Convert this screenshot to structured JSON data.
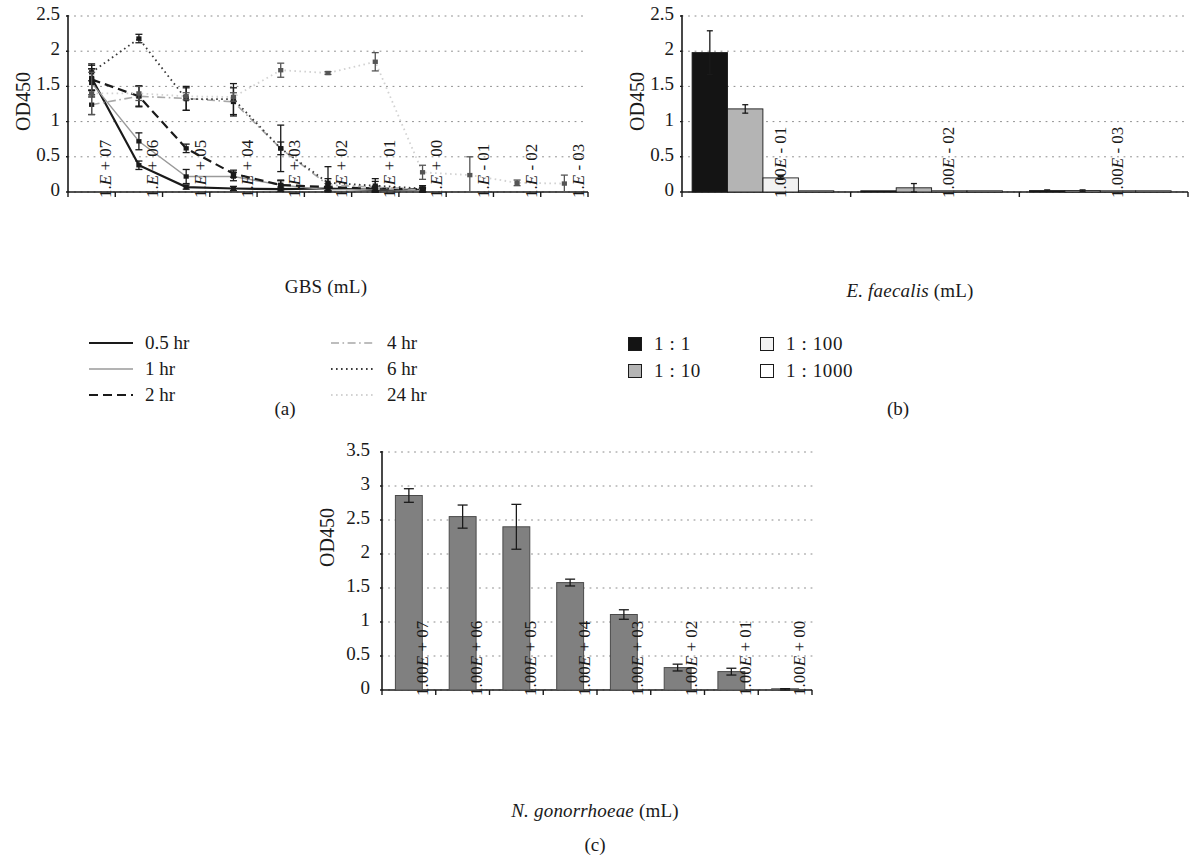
{
  "figure": {
    "panels": [
      {
        "id": "a",
        "caption": "(a)"
      },
      {
        "id": "b",
        "caption": "(b)"
      },
      {
        "id": "c",
        "caption": "(c)"
      }
    ]
  },
  "panel_a": {
    "caption": "(a)",
    "ylabel": "OD450",
    "xlabel": "GBS (mL)",
    "legend": [
      {
        "label": "0.5 hr",
        "style": "solid",
        "color": "#1a1a1a",
        "width": 2.2
      },
      {
        "label": "1 hr",
        "style": "solid",
        "color": "#9a9a9a",
        "width": 1.4
      },
      {
        "label": "2 hr",
        "style": "dashed",
        "color": "#1a1a1a",
        "width": 2.2
      },
      {
        "label": "4 hr",
        "style": "dashdot",
        "color": "#a8a8a8",
        "width": 1.6
      },
      {
        "label": "6 hr",
        "style": "dotted",
        "color": "#3a3a3a",
        "width": 1.8
      },
      {
        "label": "24 hr",
        "style": "dotted",
        "color": "#d2d2d2",
        "width": 1.8
      }
    ]
  },
  "panel_b": {
    "caption": "(b)",
    "ylabel": "OD450",
    "xlabel_parts": {
      "italic": "E. faecalis",
      "plain": " (mL)"
    },
    "legend": [
      {
        "label": "1 : 1",
        "fill": "#141414"
      },
      {
        "label": "1 : 10",
        "fill": "#b4b4b4"
      },
      {
        "label": "1 : 100",
        "fill": "#f2f2f2"
      },
      {
        "label": "1 : 1000",
        "fill": "#ffffff"
      }
    ]
  },
  "panel_c": {
    "caption": "(c)",
    "ylabel": "OD450",
    "xlabel_parts": {
      "italic": "N. gonorrhoeae",
      "plain": " (mL)"
    },
    "bar_fill": "#808080"
  },
  "chart_data": [
    {
      "panel": "a",
      "type": "line",
      "title": "",
      "xlabel": "GBS (mL)",
      "ylabel": "OD450",
      "ylim": [
        0,
        2.5
      ],
      "yticks": [
        "0",
        "0.5",
        "1",
        "1.5",
        "2",
        "2.5"
      ],
      "grid": "horizontal-dotted",
      "legend_position": "below",
      "categories": [
        "1.E + 07",
        "1.E + 06",
        "1.E + 05",
        "1.E + 04",
        "1.E + 03",
        "1.E + 02",
        "1.E + 01",
        "1.E + 00",
        "1.E - 01",
        "1.E - 02",
        "1.E - 03"
      ],
      "series": [
        {
          "name": "0.5 hr",
          "values": [
            1.62,
            0.38,
            0.07,
            0.05,
            0.04,
            0.05,
            0.03,
            0.03,
            null,
            null,
            null
          ],
          "errors": [
            0.18,
            0.06,
            0.03,
            0.03,
            0.03,
            0.03,
            0.03,
            0.02,
            null,
            null,
            null
          ]
        },
        {
          "name": "1 hr",
          "values": [
            1.55,
            0.72,
            0.22,
            0.22,
            0.1,
            0.03,
            0.04,
            0.02,
            null,
            null,
            null
          ],
          "errors": [
            0.2,
            0.12,
            0.1,
            0.06,
            0.06,
            0.02,
            0.04,
            0.02,
            null,
            null,
            null
          ]
        },
        {
          "name": "2 hr",
          "values": [
            1.6,
            1.36,
            0.62,
            0.26,
            0.1,
            0.07,
            0.05,
            0.04,
            null,
            null,
            null
          ],
          "errors": [
            0.15,
            0.15,
            0.06,
            0.05,
            0.07,
            0.05,
            0.03,
            0.03,
            null,
            null,
            null
          ]
        },
        {
          "name": "4 hr",
          "values": [
            1.24,
            1.36,
            1.33,
            1.28,
            0.62,
            0.1,
            0.07,
            0.03,
            null,
            null,
            null
          ],
          "errors": [
            0.14,
            0.14,
            0.17,
            0.2,
            0.33,
            0.26,
            0.08,
            0.03,
            null,
            null,
            null
          ]
        },
        {
          "name": "6 hr",
          "values": [
            1.7,
            2.18,
            1.32,
            1.32,
            0.62,
            0.13,
            0.09,
            0.05,
            null,
            null,
            null
          ],
          "errors": [
            0.12,
            0.06,
            0.16,
            0.22,
            0.09,
            0.06,
            0.1,
            0.04,
            null,
            null,
            null
          ]
        },
        {
          "name": "24 hr",
          "values": [
            1.4,
            1.4,
            1.36,
            1.35,
            1.73,
            1.69,
            1.85,
            0.28,
            0.24,
            0.13,
            0.12
          ],
          "errors": [
            0.3,
            0.1,
            0.05,
            0.06,
            0.1,
            0.02,
            0.13,
            0.1,
            0.26,
            0.04,
            0.12
          ]
        }
      ]
    },
    {
      "panel": "b",
      "type": "bar",
      "title": "",
      "xlabel": "E. faecalis (mL)",
      "ylabel": "OD450",
      "ylim": [
        0,
        2.5
      ],
      "yticks": [
        "0",
        "0.5",
        "1",
        "1.5",
        "2",
        "2.5"
      ],
      "grid": "horizontal-dotted",
      "legend_position": "below",
      "categories": [
        "1.00E - 01",
        "1.00E - 02",
        "1.00E - 03"
      ],
      "series": [
        {
          "name": "1 : 1",
          "values": [
            1.98,
            0.01,
            0.02
          ],
          "errors": [
            0.31,
            0.0,
            0.01
          ]
        },
        {
          "name": "1 : 10",
          "values": [
            1.18,
            0.06,
            0.02
          ],
          "errors": [
            0.06,
            0.06,
            0.01
          ]
        },
        {
          "name": "1 : 100",
          "values": [
            0.2,
            0.01,
            0.01
          ],
          "errors": [
            0.02,
            0.0,
            0.0
          ]
        },
        {
          "name": "1 : 1000",
          "values": [
            0.01,
            0.01,
            0.01
          ],
          "errors": [
            0.0,
            0.0,
            0.0
          ]
        }
      ]
    },
    {
      "panel": "c",
      "type": "bar",
      "title": "",
      "xlabel": "N. gonorrhoeae (mL)",
      "ylabel": "OD450",
      "ylim": [
        0,
        3.5
      ],
      "yticks": [
        "0",
        "0.5",
        "1",
        "1.5",
        "2",
        "2.5",
        "3",
        "3.5"
      ],
      "grid": "horizontal-dotted",
      "legend_position": "none",
      "categories": [
        "1.00E + 07",
        "1.00E + 06",
        "1.00E + 05",
        "1.00E + 04",
        "1.00E + 03",
        "1.00E + 02",
        "1.00E + 01",
        "1.00E + 00"
      ],
      "values": [
        2.86,
        2.55,
        2.4,
        1.58,
        1.11,
        0.33,
        0.27,
        0.01
      ],
      "errors": [
        0.1,
        0.17,
        0.33,
        0.05,
        0.07,
        0.05,
        0.05,
        0.01
      ]
    }
  ]
}
